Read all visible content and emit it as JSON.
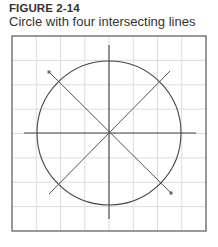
{
  "figure": {
    "number": "FIGURE 2-14",
    "caption": "Circle with four intersecting lines"
  },
  "diagram": {
    "grid": {
      "columns": 8,
      "rows": 8
    },
    "colors": {
      "frame": "#555555",
      "grid": "#dcdcdc",
      "lines": "#444444"
    },
    "shapes": [
      {
        "type": "circle",
        "name": "circle"
      },
      {
        "type": "line",
        "name": "horizontal-line"
      },
      {
        "type": "line",
        "name": "vertical-line"
      },
      {
        "type": "line",
        "name": "diagonal-line-descending",
        "endpoint_markers": "both-ends-one-marked"
      },
      {
        "type": "line",
        "name": "diagonal-line-ascending"
      }
    ]
  }
}
